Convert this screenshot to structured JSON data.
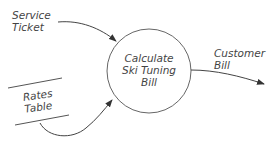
{
  "diagram": {
    "type": "data-flow-diagram",
    "colors": {
      "stroke": "#555555",
      "text": "#444444",
      "background": "#ffffff"
    },
    "external_entity": {
      "line1": "Service",
      "line2": "Ticket"
    },
    "process": {
      "line1": "Calculate",
      "line2": "Ski Tuning",
      "line3": "Bill"
    },
    "data_store": {
      "line1": "Rates",
      "line2": "Table"
    },
    "output": {
      "line1": "Customer",
      "line2": "Bill"
    },
    "flows": [
      {
        "from": "Service Ticket",
        "to": "Calculate Ski Tuning Bill"
      },
      {
        "from": "Rates Table",
        "to": "Calculate Ski Tuning Bill"
      },
      {
        "from": "Calculate Ski Tuning Bill",
        "to": "Customer Bill"
      }
    ]
  }
}
